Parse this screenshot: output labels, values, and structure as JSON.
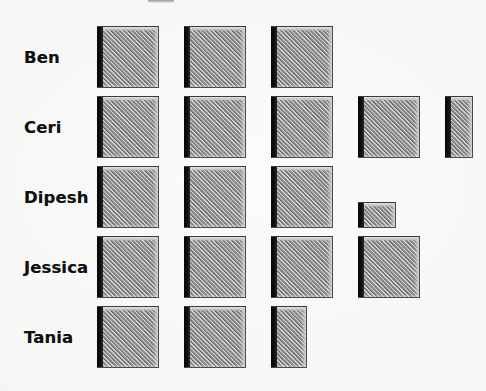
{
  "chart_data": {
    "type": "bar",
    "variant": "pictogram",
    "title": "",
    "xlabel": "",
    "ylabel": "",
    "categories": [
      "Ben",
      "Ceri",
      "Dipesh",
      "Jessica",
      "Tania"
    ],
    "values": [
      3,
      4.4,
      3.25,
      4,
      2.55
    ],
    "unit_per_symbol": 1,
    "symbol": "hatched-grey-square",
    "grid": false,
    "legend": false,
    "xlim": [
      0,
      5
    ],
    "series": [
      {
        "name": "count",
        "values": [
          3,
          4.4,
          3.25,
          4,
          2.55
        ]
      }
    ],
    "rows": [
      {
        "label": "Ben",
        "value": 3,
        "full_symbols": 3,
        "partial_symbols": []
      },
      {
        "label": "Ceri",
        "value": 4.4,
        "full_symbols": 4,
        "partial_symbols": [
          {
            "width_fraction": 0.45,
            "height_fraction": 1
          }
        ]
      },
      {
        "label": "Dipesh",
        "value": 3.25,
        "full_symbols": 3,
        "partial_symbols": [
          {
            "width_fraction": 0.62,
            "height_fraction": 0.42
          }
        ]
      },
      {
        "label": "Jessica",
        "value": 4,
        "full_symbols": 4,
        "partial_symbols": []
      },
      {
        "label": "Tania",
        "value": 2.55,
        "full_symbols": 2,
        "partial_symbols": [
          {
            "width_fraction": 0.58,
            "height_fraction": 1
          }
        ]
      }
    ]
  },
  "colors": {
    "page_background": "#f6f6f4",
    "symbol_fill": "#9a9a9a",
    "symbol_hatch_light": "#e6e6e4",
    "symbol_hatch_dark": "#5a5a5a",
    "symbol_left_face": "#0a0a0a",
    "symbol_outline": "#3b3b3b",
    "label_text": "#111111"
  },
  "layout": {
    "label_column_x": 24,
    "blocks_origin_x": 97,
    "symbol_width": 62,
    "symbol_height": 62,
    "symbol_pitch_x": 87,
    "row_pitch_y": 70,
    "first_row_y": 26
  }
}
